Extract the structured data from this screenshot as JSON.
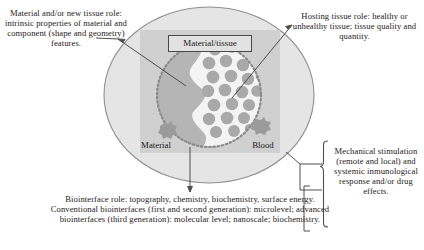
{
  "figure": {
    "callouts": {
      "material_role": "Material and/or new tissue role: intrinsic properties of material and component (shape and geometry) features.",
      "hosting_tissue": "Hosting tissue role: healthy or unhealthy tissue; tissue quality and quantity.",
      "mechanical": "Mechanical stimulation (remote and local) and systemic inmunological response and/or drug effects.",
      "biointerface": "Biointerface role: topography, chemistry, biochemistry, surface energy. Conventional biointerfaces (first and second generation): microlevel; advanced biointerfaces (third generation): molecular level; nanoscale; biochemistry."
    },
    "labels": {
      "material_tissue": "Material/tissue",
      "material": "Material",
      "blood": "Blood"
    },
    "colors": {
      "ellipse_fill": "#e3e3e3",
      "ellipse_stroke": "#8d8d8d",
      "panel_fill": "#cfcfcf",
      "material_fill": "#b4b4b4",
      "blood_fill": "#f2f2f2",
      "cell_fill": "#a8a8a8",
      "dotted_ring": "#8a8a8a",
      "leader_line": "#4f4f4f",
      "text": "#262020",
      "box_fill": "#e2e2e2",
      "box_stroke": "#4a4a4a"
    }
  }
}
